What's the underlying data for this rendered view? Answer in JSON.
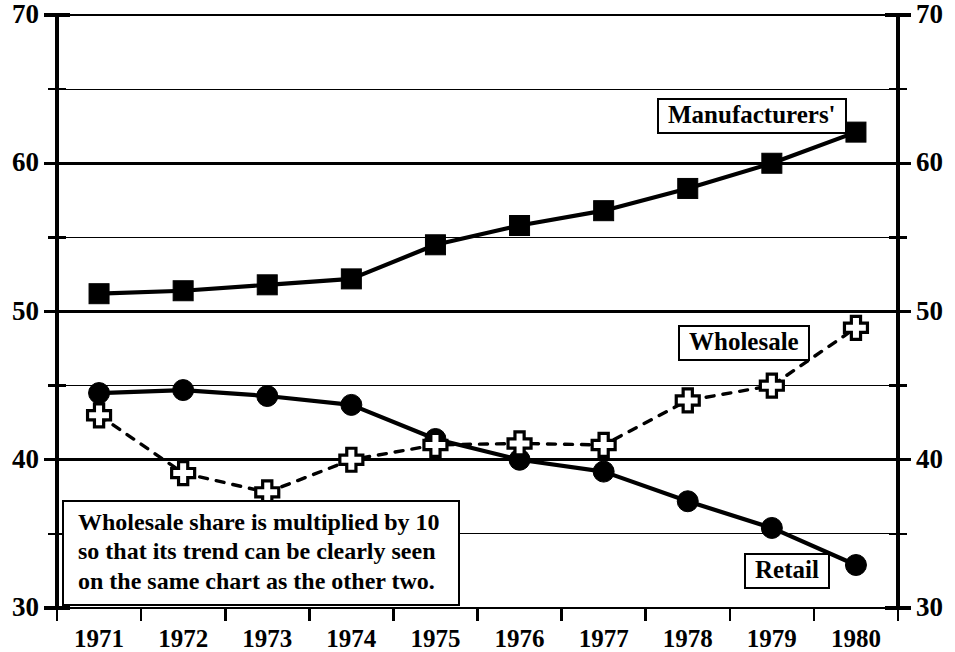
{
  "chart_data": {
    "type": "line",
    "title": "",
    "subtitle": "",
    "xlabel": "",
    "ylabel": "",
    "x": [
      1971,
      1972,
      1973,
      1974,
      1975,
      1976,
      1977,
      1978,
      1979,
      1980
    ],
    "xtick_labels": [
      "1971",
      "1972",
      "1973",
      "1974",
      "1975",
      "1976",
      "1977",
      "1978",
      "1979",
      "1980"
    ],
    "ylim": [
      30,
      70
    ],
    "ytick_labels_left": [
      "70",
      "60",
      "50",
      "40",
      "30"
    ],
    "ytick_labels_right": [
      "70",
      "60",
      "50",
      "40",
      "30"
    ],
    "ymajor_ticks": [
      70,
      60,
      50,
      40,
      30
    ],
    "yminor_ticks": [
      65,
      55,
      45,
      35
    ],
    "grid": "horizontal",
    "legend_position": "inline-labels",
    "series": [
      {
        "name": "Manufacturers'",
        "marker": "filled-square",
        "line_style": "solid",
        "color": "#000000",
        "values": [
          51.2,
          51.4,
          51.8,
          52.2,
          54.5,
          55.8,
          56.8,
          58.3,
          60.0,
          62.1
        ]
      },
      {
        "name": "Retail",
        "marker": "filled-circle",
        "line_style": "solid",
        "color": "#000000",
        "values": [
          44.5,
          44.7,
          44.3,
          43.7,
          41.4,
          40.0,
          39.2,
          37.2,
          35.4,
          32.9
        ]
      },
      {
        "name": "Wholesale",
        "marker": "open-cross",
        "line_style": "dashed",
        "color": "#000000",
        "values": [
          43.0,
          39.1,
          37.8,
          40.0,
          41.0,
          41.1,
          41.0,
          44.0,
          45.0,
          48.9
        ]
      }
    ],
    "annotation": {
      "lines": [
        "Wholesale share is multiplied by 10",
        "so that its trend can be clearly seen",
        "on the same chart as the other two."
      ]
    }
  },
  "series_labels": {
    "manufacturers": "Manufacturers'",
    "wholesale": "Wholesale",
    "retail": "Retail"
  }
}
